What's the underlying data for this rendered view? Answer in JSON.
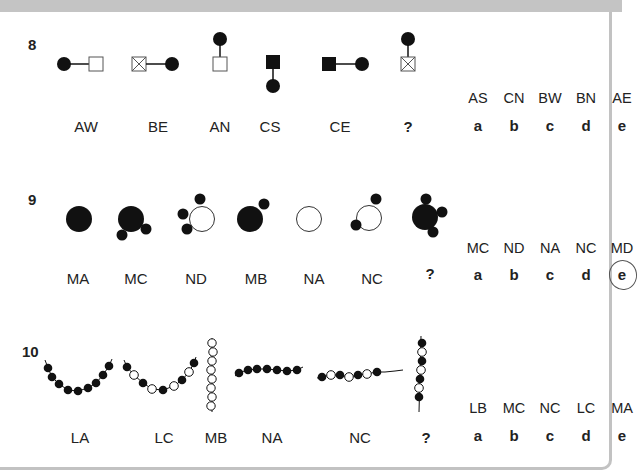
{
  "questions": [
    {
      "number": "8",
      "figures": [
        {
          "label": "AW",
          "shape": "filled-circle-line-open-square-horizontal"
        },
        {
          "label": "BE",
          "shape": "crossed-square-line-filled-circle-horizontal"
        },
        {
          "label": "AN",
          "shape": "filled-circle-above-open-square"
        },
        {
          "label": "CS",
          "shape": "filled-square-above-filled-circle"
        },
        {
          "label": "CE",
          "shape": "filled-square-line-filled-circle-horizontal"
        },
        {
          "label": "?",
          "shape": "filled-circle-above-crossed-square"
        }
      ],
      "options": {
        "codes": [
          "AS",
          "CN",
          "BW",
          "BN",
          "AE"
        ],
        "letters": [
          "a",
          "b",
          "c",
          "d",
          "e"
        ],
        "circled": null
      }
    },
    {
      "number": "9",
      "figures": [
        {
          "label": "MA",
          "shape": "large-filled-circle"
        },
        {
          "label": "MC",
          "shape": "large-filled-circle-two-small-bottom"
        },
        {
          "label": "ND",
          "shape": "open-circle-three-small-left"
        },
        {
          "label": "MB",
          "shape": "large-filled-circle-one-small-top-right"
        },
        {
          "label": "NA",
          "shape": "open-circle"
        },
        {
          "label": "NC",
          "shape": "open-circle-two-small"
        },
        {
          "label": "?",
          "shape": "large-filled-circle-three-small-right"
        }
      ],
      "options": {
        "codes": [
          "MC",
          "ND",
          "NA",
          "NC",
          "MD"
        ],
        "letters": [
          "a",
          "b",
          "c",
          "d",
          "e"
        ],
        "circled": "e"
      }
    },
    {
      "number": "10",
      "figures": [
        {
          "label": "LA",
          "shape": "u-chain-all-filled"
        },
        {
          "label": "LC",
          "shape": "u-chain-alternating"
        },
        {
          "label": "MB",
          "shape": "vertical-chain-all-open"
        },
        {
          "label": "NA",
          "shape": "horizontal-chain-all-filled"
        },
        {
          "label": "NC",
          "shape": "horizontal-chain-alternating"
        },
        {
          "label": "?",
          "shape": "vertical-chain-alternating"
        }
      ],
      "options": {
        "codes": [
          "LB",
          "MC",
          "NC",
          "LC",
          "MA"
        ],
        "letters": [
          "a",
          "b",
          "c",
          "d",
          "e"
        ],
        "circled": null
      }
    }
  ]
}
